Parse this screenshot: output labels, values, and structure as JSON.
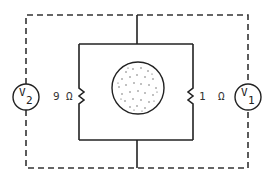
{
  "diagram": {
    "type": "circuit",
    "components": {
      "voltmeter_left": {
        "symbol": "V",
        "subscript": "2"
      },
      "voltmeter_right": {
        "symbol": "V",
        "subscript": "1"
      },
      "resistor_left": {
        "value": "9",
        "unit": "Ω"
      },
      "resistor_right": {
        "value": "1",
        "unit": "Ω"
      },
      "sample": {
        "shape": "circle",
        "fill": "stippled"
      }
    },
    "colors": {
      "line": "#222222",
      "background": "#ffffff"
    }
  }
}
